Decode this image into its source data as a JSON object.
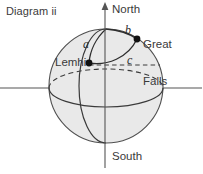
{
  "figure": {
    "title": "Diagram ii",
    "width": 203,
    "height": 174,
    "background": "#ffffff"
  },
  "axes": {
    "polar_axis": {
      "north_label": "North",
      "south_label": "South",
      "arrow": "up-arrow",
      "color": "#555555"
    },
    "horizontal_axis": {
      "color": "#555555"
    }
  },
  "sphere": {
    "fill": "#e8e8e8",
    "stroke": "#4a4a4a",
    "center_x": 106,
    "center_y": 86,
    "radius": 57
  },
  "equator": {
    "front_style": "solid",
    "back_style": "dashed",
    "stroke": "#3a3a3a"
  },
  "meridian": {
    "stroke": "#3a3a3a",
    "style": "solid"
  },
  "points": [
    {
      "id": "lemhi",
      "label": "Lemhi",
      "x": 89,
      "y": 63,
      "marker": "filled-circle",
      "color": "#111111"
    },
    {
      "id": "great-falls",
      "label": "Great\nFalls",
      "label_line1": "Great",
      "label_line2": "Falls",
      "x": 137,
      "y": 39,
      "marker": "filled-circle",
      "color": "#111111"
    }
  ],
  "arcs": [
    {
      "id": "arc-a",
      "label": "a",
      "from": "lemhi",
      "to": "north-pole",
      "stroke": "#2e2e2e"
    },
    {
      "id": "arc-b",
      "label": "b",
      "from": "north-pole",
      "to": "great-falls",
      "stroke": "#2e2e2e"
    },
    {
      "id": "arc-c",
      "label": "c",
      "from": "lemhi",
      "to": "great-falls",
      "stroke": "#2e2e2e"
    }
  ]
}
